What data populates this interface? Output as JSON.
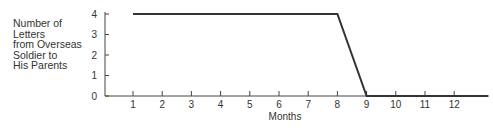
{
  "chart_data": {
    "type": "line",
    "title": "",
    "ylabel_lines": [
      "Number of",
      "Letters",
      "from Overseas",
      "Soldier to",
      "His Parents"
    ],
    "xlabel": "Months",
    "x": [
      1,
      2,
      3,
      4,
      5,
      6,
      7,
      8,
      9,
      10,
      11,
      12
    ],
    "x_tick_labels": [
      "1",
      "2",
      "3",
      "4",
      "5",
      "6",
      "7",
      "8",
      "9",
      "10",
      "11",
      "12"
    ],
    "y_tick_labels": [
      "0",
      "1",
      "2",
      "3",
      "4"
    ],
    "series": [
      {
        "name": "Letters",
        "values": [
          4,
          4,
          4,
          4,
          4,
          4,
          4,
          4,
          0,
          0,
          0,
          0
        ]
      }
    ],
    "ylim": [
      0,
      4
    ],
    "xlim": [
      0,
      13.2
    ],
    "grid": false,
    "legend": "none"
  }
}
